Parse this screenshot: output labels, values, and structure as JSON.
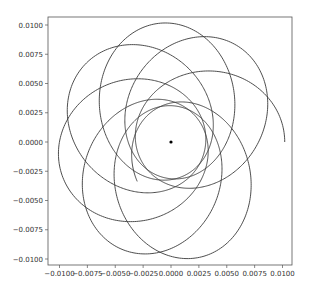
{
  "chart_data": {
    "type": "line",
    "title": "",
    "xlabel": "",
    "ylabel": "",
    "xlim": [
      -0.0105,
      0.0105
    ],
    "ylim": [
      -0.0106,
      0.0106
    ],
    "grid": false,
    "legend": null,
    "x_ticks": [
      "-0.0100",
      "-0.0075",
      "-0.0050",
      "-0.0025",
      "0.0000",
      "0.0025",
      "0.0050",
      "0.0075",
      "0.0100"
    ],
    "y_ticks": [
      "0.0100",
      "0.0075",
      "0.0050",
      "0.0025",
      "0.0000",
      "-0.0025",
      "-0.0050",
      "-0.0075",
      "-0.0100"
    ],
    "x_tick_values": [
      -0.01,
      -0.0075,
      -0.005,
      -0.0025,
      0,
      0.0025,
      0.005,
      0.0075,
      0.01
    ],
    "y_tick_values": [
      0.01,
      0.0075,
      0.005,
      0.0025,
      0,
      -0.0025,
      -0.005,
      -0.0075,
      -0.01
    ],
    "series": [
      {
        "name": "orbit",
        "kind": "precessing-ellipse",
        "color": "#3a3a3a",
        "aphelion_r": 0.0102,
        "perihelion_r": 0.0031,
        "precession_deg_per_orbit": 48,
        "start_angle_deg": 0,
        "end_theta_deg": 2748,
        "start_point": [
          0.0101,
          0.0
        ],
        "end_point": [
          0.0048,
          -0.0077
        ]
      },
      {
        "name": "central-body",
        "kind": "point",
        "color": "#000000",
        "x": 0.0,
        "y": 0.0
      }
    ]
  },
  "axes_px": {
    "left": 48,
    "top": 17,
    "right": 292,
    "bottom": 265,
    "x0_px": 171,
    "y0_px": 142,
    "x_px_per_unit": 11150,
    "y_px_per_unit": 11700
  },
  "colors": {
    "frame": "#555555",
    "line": "#3a3a3a",
    "point": "#000000",
    "text": "#333333"
  }
}
